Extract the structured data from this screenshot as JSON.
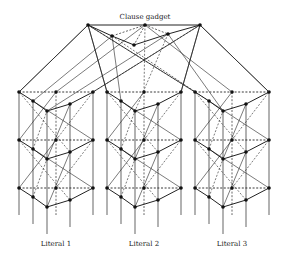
{
  "title": "Clause gadget",
  "literals": [
    {
      "label": "Literal 1",
      "offset_x": 0
    },
    {
      "label": "Literal 2",
      "offset_x": 88
    },
    {
      "label": "Literal 3",
      "offset_x": 176
    }
  ],
  "clause_nodes": [
    {
      "x": 88,
      "y": 25
    },
    {
      "x": 145,
      "y": 25
    },
    {
      "x": 200,
      "y": 25
    },
    {
      "x": 112,
      "y": 36
    },
    {
      "x": 168,
      "y": 34
    },
    {
      "x": 134,
      "y": 45
    }
  ],
  "colors": {
    "line": "#222222",
    "node": "#111111"
  }
}
